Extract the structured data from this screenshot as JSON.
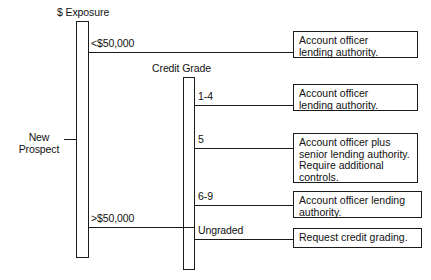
{
  "diagram": {
    "title_root": "New\nProspect",
    "decision_nodes": [
      {
        "id": "exposure",
        "heading": "$ Exposure",
        "branches": [
          {
            "label": "<$50,000",
            "target_box": 0
          },
          {
            "label": ">$50,000",
            "target_box": null
          }
        ]
      },
      {
        "id": "credit-grade",
        "heading": "Credit Grade",
        "branches": [
          {
            "label": "1-4",
            "target_box": 1
          },
          {
            "label": "5",
            "target_box": 2
          },
          {
            "label": "6-9",
            "target_box": 3
          },
          {
            "label": "Ungraded",
            "target_box": 4
          }
        ]
      }
    ],
    "outcomes": [
      {
        "text": "Account officer\nlending authority."
      },
      {
        "text": "Account officer\nlending authority."
      },
      {
        "text": "Account officer plus\nsenior lending authority.\nRequire additional\ncontrols."
      },
      {
        "text": "Account officer lending\nauthority."
      },
      {
        "text": "Request credit grading."
      }
    ],
    "colors": {
      "stroke": "#1a1a1a",
      "background": "#ffffff",
      "text": "#111111"
    }
  }
}
